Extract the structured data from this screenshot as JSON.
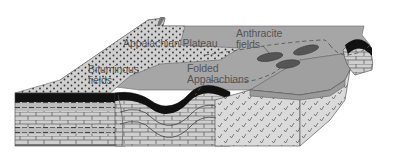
{
  "figure": {
    "type": "geologic-block-diagram"
  },
  "labels": {
    "appalachian_plateau": "Appalachian Plateau",
    "anthracite_line1": "Anthracite",
    "anthracite_line2": "fields",
    "bituminous_line1": "Bituminous",
    "bituminous_line2": "fields",
    "folded_line1": "Folded",
    "folded_line2": "Appalachians"
  },
  "colors": {
    "surface": "#a6a6a6",
    "surface_dark": "#8c8c8c",
    "plateau_stipple": "#cfcfcf",
    "coal": "#111111",
    "rock_light": "#d2d2d2",
    "rock_mid": "#bdbdbd",
    "basement": "#d9d9d9",
    "outline": "#444444",
    "label_text": "#555555"
  }
}
